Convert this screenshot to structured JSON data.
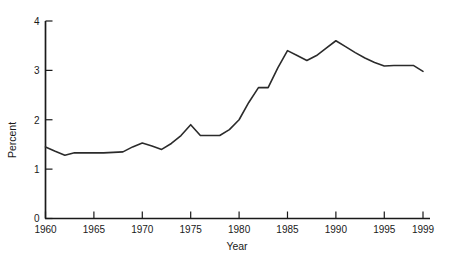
{
  "chart_data": {
    "type": "line",
    "title": "",
    "xlabel": "Year",
    "ylabel": "Percent",
    "xlim": [
      1960,
      1999
    ],
    "ylim": [
      0,
      4
    ],
    "grid": false,
    "legend": null,
    "xticks": [
      1960,
      1965,
      1970,
      1975,
      1980,
      1985,
      1990,
      1995,
      1999
    ],
    "xtick_labels": [
      "1960",
      "1965",
      "1970",
      "1975",
      "1980",
      "1985",
      "1990",
      "1995",
      "1999"
    ],
    "yticks": [
      0,
      1,
      2,
      3,
      4
    ],
    "ytick_labels": [
      "0",
      "1",
      "2",
      "3",
      "4"
    ],
    "line_color": "#2b2b2b",
    "line_width": 1.6,
    "x": [
      1960,
      1961,
      1962,
      1963,
      1964,
      1965,
      1966,
      1967,
      1968,
      1969,
      1970,
      1971,
      1972,
      1973,
      1974,
      1975,
      1976,
      1977,
      1978,
      1979,
      1980,
      1981,
      1982,
      1983,
      1984,
      1985,
      1986,
      1987,
      1988,
      1989,
      1990,
      1991,
      1992,
      1993,
      1994,
      1995,
      1996,
      1997,
      1998,
      1999
    ],
    "values": [
      1.45,
      1.36,
      1.28,
      1.33,
      1.33,
      1.33,
      1.33,
      1.34,
      1.35,
      1.45,
      1.53,
      1.47,
      1.4,
      1.52,
      1.68,
      1.9,
      1.68,
      1.68,
      1.68,
      1.8,
      2.0,
      2.35,
      2.65,
      2.65,
      3.05,
      3.4,
      3.3,
      3.2,
      3.3,
      3.45,
      3.6,
      3.48,
      3.36,
      3.25,
      3.16,
      3.09,
      3.1,
      3.1,
      3.1,
      2.98
    ],
    "series": [
      {
        "name": "Percent",
        "values": [
          1.45,
          1.36,
          1.28,
          1.33,
          1.33,
          1.33,
          1.33,
          1.34,
          1.35,
          1.45,
          1.53,
          1.47,
          1.4,
          1.52,
          1.68,
          1.9,
          1.68,
          1.68,
          1.68,
          1.8,
          2.0,
          2.35,
          2.65,
          2.65,
          3.05,
          3.4,
          3.3,
          3.2,
          3.3,
          3.45,
          3.6,
          3.48,
          3.36,
          3.25,
          3.16,
          3.09,
          3.1,
          3.1,
          3.1,
          2.98
        ]
      }
    ]
  },
  "axes": {
    "x_title": "Year",
    "y_title": "Percent",
    "x_tick_0": "1960",
    "x_tick_1": "1965",
    "x_tick_2": "1970",
    "x_tick_3": "1975",
    "x_tick_4": "1980",
    "x_tick_5": "1985",
    "x_tick_6": "1990",
    "x_tick_7": "1995",
    "x_tick_8": "1999",
    "y_tick_0": "0",
    "y_tick_1": "1",
    "y_tick_2": "2",
    "y_tick_3": "3",
    "y_tick_4": "4"
  },
  "style": {
    "background": "#ffffff",
    "axis_color": "#1a1a1a",
    "line_color": "#2b2b2b"
  }
}
